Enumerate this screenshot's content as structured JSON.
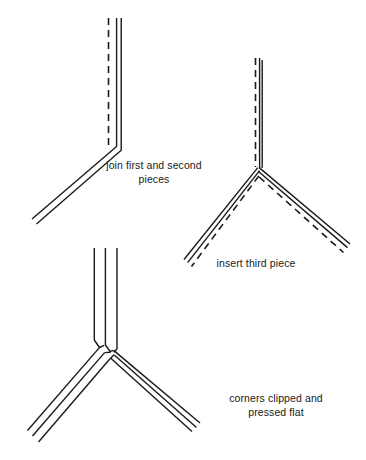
{
  "figure": {
    "background_color": "#ffffff",
    "line_color": "#1a1a1a",
    "text_color": "#1a1a1a",
    "width": 366,
    "height": 460
  },
  "steps": [
    {
      "id": "step-1",
      "caption": "join first and second\npieces",
      "description": "Two strip pieces joined at a corner; vertical piece with dashed fold line, bending into a piece running down to the lower left."
    },
    {
      "id": "step-2",
      "caption": "insert third piece",
      "description": "Y-shaped junction of three pieces with dashed fold lines shown alongside the vertical stem and both lower arms."
    },
    {
      "id": "step-3",
      "caption": "corners clipped and\npressed flat",
      "description": "Completed three-way junction drawn with triple solid lines on the stem and both arms, corners clipped at the centre."
    }
  ],
  "geometry": {
    "step1": {
      "vertex": [
        115,
        148
      ],
      "stem_top": [
        117,
        18
      ],
      "arm_end": [
        33,
        220
      ],
      "dashed_top": [
        108,
        18
      ],
      "dashed_bottom": [
        108,
        145
      ]
    },
    "step2": {
      "vertex": [
        258,
        168
      ],
      "stem_top": [
        260,
        58
      ],
      "left_arm_end": [
        185,
        260
      ],
      "right_arm_end": [
        350,
        245
      ]
    },
    "step3": {
      "vertex": [
        106,
        355
      ],
      "stem_top": [
        105,
        248
      ],
      "left_arm_end": [
        28,
        440
      ],
      "right_arm_end": [
        200,
        425
      ]
    }
  },
  "line_style": {
    "solid_width": 1.4,
    "dash_pattern": "7 5",
    "dash_width": 1.6
  }
}
